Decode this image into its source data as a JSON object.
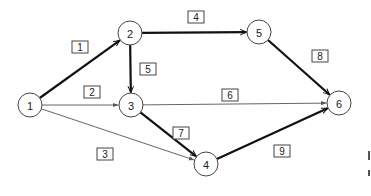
{
  "diagram": {
    "type": "network-activity-graph",
    "node_radius": 12,
    "colors": {
      "stroke": "#444444",
      "edge_bold": "#111111",
      "edge_thin": "#555555",
      "background": "#ffffff"
    },
    "nodes": [
      {
        "id": "1",
        "label": "1",
        "x": 30,
        "y": 105
      },
      {
        "id": "2",
        "label": "2",
        "x": 130,
        "y": 33
      },
      {
        "id": "3",
        "label": "3",
        "x": 131,
        "y": 105
      },
      {
        "id": "4",
        "label": "4",
        "x": 206,
        "y": 164
      },
      {
        "id": "5",
        "label": "5",
        "x": 259,
        "y": 32
      },
      {
        "id": "6",
        "label": "6",
        "x": 339,
        "y": 103
      }
    ],
    "edges": [
      {
        "id": "e1",
        "from": "1",
        "to": "2",
        "label": "1",
        "bold": true,
        "label_x": 80,
        "label_y": 47
      },
      {
        "id": "e2",
        "from": "1",
        "to": "3",
        "label": "2",
        "bold": false,
        "label_x": 92,
        "label_y": 92
      },
      {
        "id": "e3",
        "from": "1",
        "to": "4",
        "label": "3",
        "bold": false,
        "label_x": 105,
        "label_y": 154
      },
      {
        "id": "e4",
        "from": "2",
        "to": "5",
        "label": "4",
        "bold": true,
        "label_x": 196,
        "label_y": 17
      },
      {
        "id": "e5",
        "from": "2",
        "to": "3",
        "label": "5",
        "bold": true,
        "label_x": 148,
        "label_y": 69
      },
      {
        "id": "e6",
        "from": "3",
        "to": "6",
        "label": "6",
        "bold": false,
        "label_x": 230,
        "label_y": 95
      },
      {
        "id": "e7",
        "from": "3",
        "to": "4",
        "label": "7",
        "bold": true,
        "label_x": 181,
        "label_y": 133
      },
      {
        "id": "e8",
        "from": "5",
        "to": "6",
        "label": "8",
        "bold": true,
        "label_x": 320,
        "label_y": 56
      },
      {
        "id": "e9",
        "from": "4",
        "to": "6",
        "label": "9",
        "bold": true,
        "label_x": 282,
        "label_y": 151
      }
    ]
  }
}
